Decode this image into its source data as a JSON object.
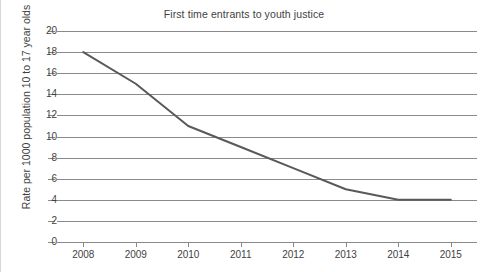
{
  "chart_data": {
    "type": "line",
    "title": "First time entrants to youth justice",
    "xlabel": "",
    "ylabel": "Rate per 1000 population 10 to 17 year olds",
    "categories": [
      "2008",
      "2009",
      "2010",
      "2011",
      "2012",
      "2013",
      "2014",
      "2015"
    ],
    "values": [
      18,
      15,
      11,
      9,
      7,
      5,
      4,
      4
    ],
    "series": [
      {
        "name": "First time entrants",
        "values": [
          18,
          15,
          11,
          9,
          7,
          5,
          4,
          4
        ]
      }
    ],
    "ylim": [
      0,
      20
    ],
    "y_ticks": [
      0,
      2,
      4,
      6,
      8,
      10,
      12,
      14,
      16,
      18,
      20
    ],
    "y_tick_labels": [
      "0",
      "2",
      "4",
      "6",
      "8",
      "10",
      "12",
      "14",
      "16",
      "18",
      "20"
    ],
    "x_tick_labels": [
      "2008",
      "2009",
      "2010",
      "2011",
      "2012",
      "2013",
      "2014",
      "2015"
    ],
    "grid": "horizontal",
    "legend": "none",
    "colors": {
      "line": "#595959",
      "grid": "#8a8a8a",
      "text": "#3f3f3f",
      "background": "#ffffff",
      "border": "#d8d8d8"
    }
  }
}
